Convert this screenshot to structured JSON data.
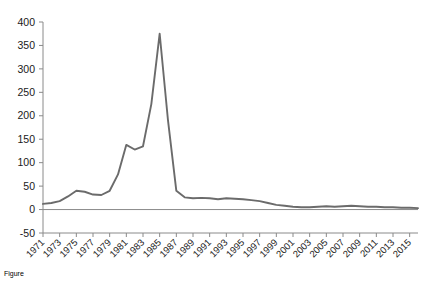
{
  "chart_data": {
    "type": "line",
    "title": "",
    "subtitle": "",
    "xlabel": "",
    "ylabel": "",
    "ylim": [
      -50,
      400
    ],
    "xlim": [
      1971,
      2016
    ],
    "grid": false,
    "legend": false,
    "legend_position": "none",
    "line_color": "#6b6b6b",
    "axis_color": "#8a8a8a",
    "text_color": "#1a1a1a",
    "y_ticks": [
      -50,
      0,
      50,
      100,
      150,
      200,
      250,
      300,
      350,
      400
    ],
    "y_tick_labels": [
      "-50",
      "0",
      "50",
      "100",
      "150",
      "200",
      "250",
      "300",
      "350",
      "400"
    ],
    "x_ticks": [
      1971,
      1973,
      1975,
      1977,
      1979,
      1981,
      1983,
      1985,
      1987,
      1989,
      1991,
      1993,
      1995,
      1997,
      1999,
      2001,
      2003,
      2005,
      2007,
      2009,
      2011,
      2013,
      2015
    ],
    "x_tick_labels": [
      "1971",
      "1973",
      "1975",
      "1977",
      "1979",
      "1981",
      "1983",
      "1985",
      "1987",
      "1989",
      "1991",
      "1993",
      "1995",
      "1997",
      "1999",
      "2001",
      "2003",
      "2005",
      "2007",
      "2009",
      "2011",
      "2013",
      "2015"
    ],
    "x_tick_rotation": 45,
    "zero_line": true,
    "series": [
      {
        "name": "value",
        "x": [
          1971,
          1972,
          1973,
          1974,
          1975,
          1976,
          1977,
          1978,
          1979,
          1980,
          1981,
          1982,
          1983,
          1984,
          1985,
          1986,
          1987,
          1988,
          1989,
          1990,
          1991,
          1992,
          1993,
          1994,
          1995,
          1996,
          1997,
          1998,
          1999,
          2000,
          2001,
          2002,
          2003,
          2004,
          2005,
          2006,
          2007,
          2008,
          2009,
          2010,
          2011,
          2012,
          2013,
          2014,
          2015,
          2016
        ],
        "values": [
          12,
          14,
          18,
          28,
          40,
          38,
          32,
          31,
          40,
          75,
          138,
          128,
          135,
          225,
          375,
          190,
          40,
          26,
          24,
          25,
          24,
          22,
          24,
          23,
          22,
          20,
          18,
          14,
          10,
          8,
          6,
          5,
          5,
          6,
          7,
          6,
          7,
          8,
          7,
          6,
          6,
          5,
          5,
          4,
          4,
          3
        ]
      }
    ],
    "annotations": []
  },
  "caption": {
    "text": "Figure"
  }
}
